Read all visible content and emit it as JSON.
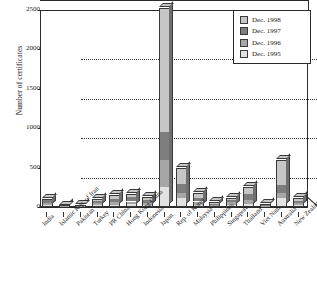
{
  "chart_data": {
    "type": "bar",
    "stacked": true,
    "title": "",
    "xlabel": "",
    "ylabel": "Number of certificates",
    "ylim": [
      0,
      2500
    ],
    "yticks": [
      0,
      500,
      1000,
      1500,
      2000,
      2500
    ],
    "grid": true,
    "legend_position": "top-right",
    "categories": [
      "India",
      "Islamic Rep. of Iran",
      "Pakistan",
      "Turkey",
      "PR China",
      "Hong Kong China",
      "Indonesia",
      "Japan",
      "Rep. of Korea",
      "Malaysia",
      "Philippines",
      "Singapore",
      "Thailand",
      "Viet Nam",
      "Australia",
      "New Zealand"
    ],
    "series": [
      {
        "name": "Dec. 1995",
        "color": "#e2e2e2",
        "values": [
          30,
          5,
          5,
          20,
          25,
          35,
          20,
          250,
          110,
          30,
          10,
          25,
          40,
          5,
          110,
          20
        ]
      },
      {
        "name": "Dec. 1996",
        "color": "#a6a6a6",
        "values": [
          55,
          8,
          8,
          45,
          60,
          70,
          50,
          600,
          180,
          70,
          25,
          60,
          90,
          10,
          180,
          45
        ]
      },
      {
        "name": "Dec. 1997",
        "color": "#7d7d7d",
        "values": [
          85,
          12,
          14,
          75,
          105,
          125,
          90,
          950,
          290,
          120,
          40,
          95,
          160,
          20,
          280,
          75
        ]
      },
      {
        "name": "Dec. 1998",
        "color": "#c6c6c6",
        "values": [
          105,
          18,
          22,
          105,
          150,
          160,
          130,
          2520,
          500,
          180,
          60,
          120,
          255,
          35,
          600,
          120
        ]
      }
    ]
  },
  "axis": {
    "y_title": "Number of certificates",
    "y_tick_labels": [
      "0",
      "500",
      "1000",
      "1500",
      "2000",
      "2500"
    ]
  },
  "legend": {
    "items": [
      {
        "label": "Dec. 1998",
        "color": "#c6c6c6"
      },
      {
        "label": "Dec. 1997",
        "color": "#7d7d7d"
      },
      {
        "label": "Dec. 1996",
        "color": "#a6a6a6"
      },
      {
        "label": "Dec. 1995",
        "color": "#e2e2e2"
      }
    ]
  }
}
